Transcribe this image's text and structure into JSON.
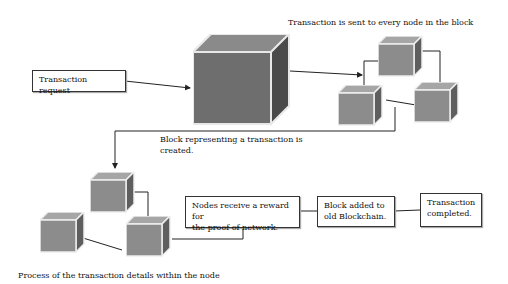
{
  "diagram": {
    "title_top": "Transaction is sent to every node in the block",
    "request_box": "Transaction request",
    "block_created_line1": "Block representing a transaction is",
    "block_created_line2": "created.",
    "process_caption": "Process of the transaction details within the node",
    "reward_box_line1": "Nodes receive a reward for",
    "reward_box_line2": "the proof of network.",
    "chain_box_line1": "Block added to",
    "chain_box_line2": "old Blockchain.",
    "completed_box_line1": "Transaction",
    "completed_box_line2": "completed."
  },
  "colors": {
    "cube_front": "#6e6e6e",
    "cube_top": "#8a8a8a",
    "cube_side": "#4a4a4a",
    "cube_edge": "#e8e8e8",
    "small_front": "#8c8c8c",
    "small_top": "#a6a6a6",
    "small_side": "#5e5e5e",
    "line": "#222222"
  }
}
